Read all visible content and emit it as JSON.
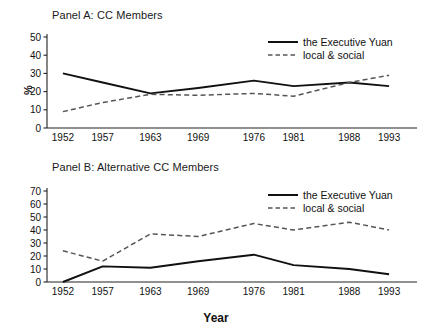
{
  "figure": {
    "xlabel": "Year",
    "ylabel": "%",
    "panels": [
      {
        "id": "A",
        "title": "Panel A: CC Members"
      },
      {
        "id": "B",
        "title": "Panel B: Alternative CC Members"
      }
    ]
  },
  "legend": {
    "entries": [
      {
        "label": "the Executive Yuan",
        "style": "solid",
        "color": "#111111"
      },
      {
        "label": "local & social",
        "style": "dashed",
        "color": "#555555"
      }
    ]
  },
  "chart_data": [
    {
      "type": "line",
      "title": "Panel A: CC Members",
      "xlabel": "",
      "ylabel": "%",
      "categories": [
        "1952",
        "1957",
        "1963",
        "1969",
        "1976",
        "1981",
        "1988",
        "1993"
      ],
      "x": [
        1952,
        1957,
        1963,
        1969,
        1976,
        1981,
        1988,
        1993
      ],
      "xlim": [
        1950,
        1995
      ],
      "ylim": [
        0,
        50
      ],
      "yticks": [
        0,
        10,
        20,
        30,
        40,
        50
      ],
      "grid": false,
      "legend_position": "top-right",
      "series": [
        {
          "name": "the Executive Yuan",
          "style": "solid",
          "color": "#111111",
          "values": [
            30,
            25,
            19,
            22,
            26,
            23,
            25,
            23
          ]
        },
        {
          "name": "local & social",
          "style": "dashed",
          "color": "#555555",
          "values": [
            9,
            14,
            18.5,
            18,
            19,
            17.5,
            25,
            29
          ]
        }
      ]
    },
    {
      "type": "line",
      "title": "Panel B: Alternative CC Members",
      "xlabel": "Year",
      "ylabel": "%",
      "categories": [
        "1952",
        "1957",
        "1963",
        "1969",
        "1976",
        "1981",
        "1988",
        "1993"
      ],
      "x": [
        1952,
        1957,
        1963,
        1969,
        1976,
        1981,
        1988,
        1993
      ],
      "xlim": [
        1950,
        1995
      ],
      "ylim": [
        0,
        70
      ],
      "yticks": [
        0,
        10,
        20,
        30,
        40,
        50,
        60,
        70
      ],
      "grid": false,
      "legend_position": "top-right",
      "series": [
        {
          "name": "the Executive Yuan",
          "style": "solid",
          "color": "#111111",
          "values": [
            0,
            12,
            11,
            16,
            21,
            13,
            10,
            6
          ]
        },
        {
          "name": "local & social",
          "style": "dashed",
          "color": "#555555",
          "values": [
            24,
            16,
            37,
            35,
            45,
            40,
            46,
            40
          ]
        }
      ]
    }
  ]
}
